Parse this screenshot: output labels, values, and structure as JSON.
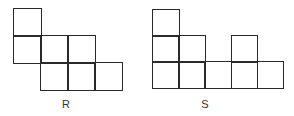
{
  "figures": [
    {
      "id": "R",
      "label": "R",
      "origin": [
        13,
        8
      ],
      "cell_size": 27,
      "cells": [
        [
          0,
          0
        ],
        [
          0,
          1
        ],
        [
          1,
          1
        ],
        [
          2,
          1
        ],
        [
          1,
          2
        ],
        [
          2,
          2
        ],
        [
          3,
          2
        ]
      ],
      "label_pos": [
        66,
        98
      ]
    },
    {
      "id": "S",
      "label": "S",
      "origin": [
        152,
        9
      ],
      "cell_size": 26.2,
      "cells": [
        [
          0,
          0
        ],
        [
          0,
          1
        ],
        [
          1,
          1
        ],
        [
          3,
          1
        ],
        [
          0,
          2
        ],
        [
          1,
          2
        ],
        [
          2,
          2
        ],
        [
          3,
          2
        ],
        [
          4,
          2
        ]
      ],
      "label_pos": [
        205,
        98
      ]
    }
  ],
  "line_color": "#2a2a2a"
}
